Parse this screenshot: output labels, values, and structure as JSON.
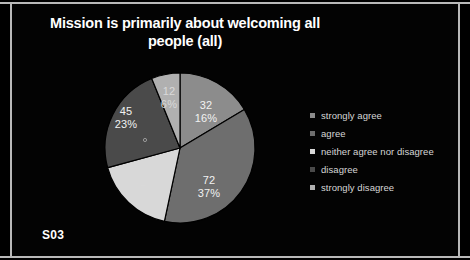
{
  "slide": {
    "title": "Mission is primarily about welcoming all people (all)",
    "title_line1": "Mission is primarily about welcoming all",
    "title_line2": "people (all)",
    "corner_tag": "S03",
    "background_color": "#000000",
    "border_color": "#b9b9b9",
    "title_color": "#ffffff"
  },
  "legend": {
    "position": "right",
    "items": [
      {
        "label": "strongly agree",
        "color": "#8c8c8c"
      },
      {
        "label": "agree",
        "color": "#6e6e6e"
      },
      {
        "label": "neither agree nor disagree",
        "color": "#d8d8d8"
      },
      {
        "label": "disagree",
        "color": "#4a4a4a"
      },
      {
        "label": "strongly disagree",
        "color": "#b0b0b0"
      }
    ]
  },
  "chart_data": {
    "type": "pie",
    "title": "Mission is primarily about welcoming all people (all)",
    "xlabel": "",
    "ylabel": "",
    "grid": false,
    "legend_position": "right",
    "total": 195,
    "start_angle_deg": 0,
    "direction": "clockwise",
    "categories": [
      "strongly agree",
      "agree",
      "neither agree nor disagree",
      "disagree",
      "strongly disagree"
    ],
    "values": [
      32,
      72,
      34,
      45,
      12
    ],
    "percentages": [
      16,
      37,
      18,
      23,
      6
    ],
    "colors": [
      "#8c8c8c",
      "#6e6e6e",
      "#d8d8d8",
      "#4a4a4a",
      "#b0b0b0"
    ],
    "slices": [
      {
        "label": "strongly agree",
        "value": 32,
        "percent": 16,
        "value_text": "32",
        "percent_text": "16%",
        "color": "#8c8c8c",
        "label_x": 113,
        "label_y": 43
      },
      {
        "label": "agree",
        "value": 72,
        "percent": 37,
        "value_text": "72",
        "percent_text": "37%",
        "color": "#6e6e6e",
        "label_x": 116,
        "label_y": 118
      },
      {
        "label": "neither agree nor disagree",
        "value": 34,
        "percent": 18,
        "value_text": "34",
        "percent_text": "18%",
        "color": "#d8d8d8",
        "label_x": 47,
        "label_y": 122
      },
      {
        "label": "disagree",
        "value": 45,
        "percent": 23,
        "value_text": "45",
        "percent_text": "23%",
        "color": "#4a4a4a",
        "label_x": 33,
        "label_y": 49
      },
      {
        "label": "strongly disagree",
        "value": 12,
        "percent": 6,
        "value_text": "12",
        "percent_text": "6%",
        "color": "#b0b0b0",
        "label_x": 76,
        "label_y": 29
      }
    ]
  }
}
